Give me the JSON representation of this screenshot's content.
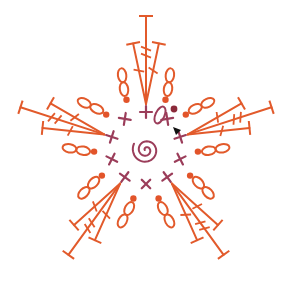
{
  "diagram": {
    "type": "crochet-chart",
    "colors": {
      "background": "#ffffff",
      "round1": "#9b3d5a",
      "round2": "#e25a2b",
      "slip_stitch_dot": "#e2542a",
      "join_dot": "#8b2a3a",
      "marker": "#111111"
    },
    "center": {
      "x": 146,
      "y": 148
    },
    "magic_ring": {
      "symbol": "spiral",
      "label": "magic ring"
    },
    "round1": {
      "stitch": "single crochet",
      "symbol": "x / +",
      "count": 10,
      "radius": 36
    },
    "round2": {
      "petals": 5,
      "petal_sequence": [
        "ch",
        "ch",
        "hdc",
        "dc",
        "tr",
        "dc",
        "hdc",
        "ch",
        "ch"
      ],
      "petal_angles_deg": [
        -90,
        -18,
        54,
        126,
        198
      ]
    },
    "legend": {
      "start_marker": "triangle marker",
      "slip_stitch": "dot"
    }
  }
}
